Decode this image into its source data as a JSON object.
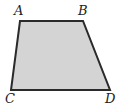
{
  "figure": {
    "shape": "trapezoid",
    "fill_color": "#d4d4d4",
    "stroke_color": "#2a2a2a",
    "vertices": [
      {
        "label": "A",
        "x": 20,
        "y": 21,
        "lx": 14,
        "ly": 15
      },
      {
        "label": "B",
        "x": 83,
        "y": 21,
        "lx": 78,
        "ly": 15
      },
      {
        "label": "D",
        "x": 110,
        "y": 90,
        "lx": 105,
        "ly": 103
      },
      {
        "label": "C",
        "x": 11,
        "y": 90,
        "lx": 5,
        "ly": 103
      }
    ]
  }
}
